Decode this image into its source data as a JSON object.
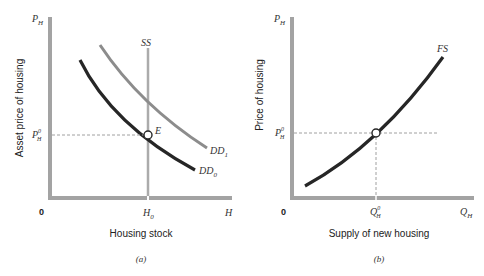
{
  "panels": [
    {
      "id": "a",
      "caption": "(a)",
      "y_axis": {
        "symbol": "P",
        "symbol_sub": "H",
        "title": "Asset price of housing",
        "tick": {
          "base": "P",
          "sup": "0",
          "sub": "H"
        }
      },
      "x_axis": {
        "origin": "0",
        "symbol": "H",
        "title": "Housing stock",
        "tick": {
          "base": "H",
          "sub": "0"
        }
      },
      "curves": [
        {
          "label": "SS",
          "type": "vertical",
          "color": "#a8a8a8"
        },
        {
          "label": "DD",
          "sub": "1",
          "color": "#8a8a8a"
        },
        {
          "label": "DD",
          "sub": "0",
          "color": "#2a2a2a"
        }
      ],
      "equilibrium_label": "E"
    },
    {
      "id": "b",
      "caption": "(b)",
      "y_axis": {
        "symbol": "P",
        "symbol_sub": "H",
        "title": "Price of housing",
        "tick": {
          "base": "P",
          "sup": "0",
          "sub": "H"
        }
      },
      "x_axis": {
        "origin": "0",
        "symbol": "Q",
        "symbol_sub": "H",
        "title": "Supply of new housing",
        "tick": {
          "base": "Q",
          "sup": "0",
          "sub": "H"
        }
      },
      "curves": [
        {
          "label": "FS",
          "color": "#2a2a2a"
        }
      ]
    }
  ],
  "colors": {
    "axis": "#a0a0a0",
    "dark_curve": "#2a2a2a",
    "light_curve": "#8a8a8a",
    "ss_line": "#ababab",
    "dashed": "#9a9a9a"
  }
}
